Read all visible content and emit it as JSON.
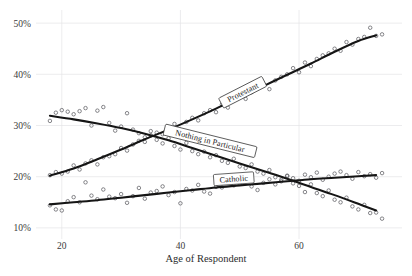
{
  "chart_data": {
    "type": "scatter",
    "title": "",
    "xlabel": "Age of Respondent",
    "ylabel": "",
    "xlim": [
      17,
      75
    ],
    "ylim": [
      9,
      51
    ],
    "grid": true,
    "legend_position": "inline-labels",
    "x_ticks": [
      20,
      40,
      60
    ],
    "x_tick_labels": [
      "20",
      "40",
      "60"
    ],
    "y_ticks": [
      10,
      20,
      30,
      40,
      50
    ],
    "y_tick_labels": [
      "10%",
      "20%",
      "30%",
      "40%",
      "50%"
    ],
    "series": [
      {
        "name": "Protestant",
        "label": "Protestant",
        "trend": [
          [
            18,
            20.2
          ],
          [
            22,
            21.6
          ],
          [
            26,
            23.4
          ],
          [
            30,
            25.3
          ],
          [
            34,
            27.3
          ],
          [
            38,
            29.2
          ],
          [
            42,
            31.2
          ],
          [
            46,
            33.3
          ],
          [
            50,
            35.5
          ],
          [
            54,
            37.7
          ],
          [
            58,
            39.9
          ],
          [
            62,
            42.1
          ],
          [
            66,
            44.4
          ],
          [
            70,
            46.5
          ],
          [
            73,
            47.6
          ]
        ],
        "points": [
          [
            18,
            20.3
          ],
          [
            19,
            20.9
          ],
          [
            20,
            20.6
          ],
          [
            21,
            21.0
          ],
          [
            22,
            22.2
          ],
          [
            23,
            21.4
          ],
          [
            24,
            22.6
          ],
          [
            25,
            23.2
          ],
          [
            26,
            22.4
          ],
          [
            27,
            23.8
          ],
          [
            28,
            24.0
          ],
          [
            29,
            24.4
          ],
          [
            30,
            25.6
          ],
          [
            31,
            25.1
          ],
          [
            32,
            26.3
          ],
          [
            33,
            27.0
          ],
          [
            34,
            26.8
          ],
          [
            35,
            28.1
          ],
          [
            36,
            28.6
          ],
          [
            37,
            28.3
          ],
          [
            38,
            29.6
          ],
          [
            39,
            30.3
          ],
          [
            40,
            29.1
          ],
          [
            41,
            30.7
          ],
          [
            42,
            31.5
          ],
          [
            43,
            31.0
          ],
          [
            44,
            32.4
          ],
          [
            45,
            33.0
          ],
          [
            46,
            32.6
          ],
          [
            47,
            34.1
          ],
          [
            48,
            33.5
          ],
          [
            49,
            34.9
          ],
          [
            50,
            35.7
          ],
          [
            51,
            35.2
          ],
          [
            52,
            36.5
          ],
          [
            53,
            37.4
          ],
          [
            54,
            38.0
          ],
          [
            55,
            37.1
          ],
          [
            56,
            38.8
          ],
          [
            57,
            39.5
          ],
          [
            58,
            40.0
          ],
          [
            59,
            41.2
          ],
          [
            60,
            40.4
          ],
          [
            61,
            42.3
          ],
          [
            62,
            41.6
          ],
          [
            63,
            43.0
          ],
          [
            64,
            43.7
          ],
          [
            65,
            44.1
          ],
          [
            66,
            45.0
          ],
          [
            67,
            44.6
          ],
          [
            68,
            46.3
          ],
          [
            69,
            45.8
          ],
          [
            70,
            46.9
          ],
          [
            71,
            47.3
          ],
          [
            72,
            49.1
          ],
          [
            73,
            47.5
          ],
          [
            74,
            47.8
          ]
        ]
      },
      {
        "name": "Nothing in Particular",
        "label": "Nothing in Particular",
        "trend": [
          [
            18,
            31.9
          ],
          [
            22,
            31.2
          ],
          [
            26,
            30.4
          ],
          [
            30,
            29.5
          ],
          [
            34,
            28.4
          ],
          [
            38,
            27.1
          ],
          [
            42,
            25.6
          ],
          [
            46,
            24.1
          ],
          [
            50,
            22.6
          ],
          [
            54,
            21.1
          ],
          [
            58,
            19.6
          ],
          [
            62,
            18.0
          ],
          [
            66,
            16.4
          ],
          [
            70,
            14.7
          ],
          [
            73,
            13.4
          ]
        ],
        "points": [
          [
            18,
            30.9
          ],
          [
            19,
            32.5
          ],
          [
            20,
            33.0
          ],
          [
            21,
            32.7
          ],
          [
            22,
            32.2
          ],
          [
            23,
            32.8
          ],
          [
            24,
            33.4
          ],
          [
            25,
            30.0
          ],
          [
            26,
            32.9
          ],
          [
            27,
            33.6
          ],
          [
            28,
            30.5
          ],
          [
            29,
            29.0
          ],
          [
            30,
            29.8
          ],
          [
            31,
            32.4
          ],
          [
            32,
            29.2
          ],
          [
            33,
            28.5
          ],
          [
            34,
            27.7
          ],
          [
            35,
            28.9
          ],
          [
            36,
            27.2
          ],
          [
            37,
            26.5
          ],
          [
            38,
            27.5
          ],
          [
            39,
            26.0
          ],
          [
            40,
            25.3
          ],
          [
            41,
            26.6
          ],
          [
            42,
            25.0
          ],
          [
            43,
            24.4
          ],
          [
            44,
            24.9
          ],
          [
            45,
            23.8
          ],
          [
            46,
            24.2
          ],
          [
            47,
            23.1
          ],
          [
            48,
            22.7
          ],
          [
            49,
            23.5
          ],
          [
            50,
            22.0
          ],
          [
            51,
            21.7
          ],
          [
            52,
            22.4
          ],
          [
            53,
            21.0
          ],
          [
            54,
            20.6
          ],
          [
            55,
            21.3
          ],
          [
            56,
            19.9
          ],
          [
            57,
            19.4
          ],
          [
            58,
            20.1
          ],
          [
            59,
            18.7
          ],
          [
            60,
            18.2
          ],
          [
            61,
            17.0
          ],
          [
            62,
            18.5
          ],
          [
            63,
            16.8
          ],
          [
            64,
            16.2
          ],
          [
            65,
            17.3
          ],
          [
            66,
            15.5
          ],
          [
            67,
            15.0
          ],
          [
            68,
            15.9
          ],
          [
            69,
            14.2
          ],
          [
            70,
            13.6
          ],
          [
            71,
            14.5
          ],
          [
            72,
            12.9
          ],
          [
            73,
            13.0
          ],
          [
            74,
            11.8
          ]
        ]
      },
      {
        "name": "Catholic",
        "label": "Catholic",
        "trend": [
          [
            18,
            14.6
          ],
          [
            22,
            15.0
          ],
          [
            26,
            15.4
          ],
          [
            30,
            15.9
          ],
          [
            34,
            16.4
          ],
          [
            38,
            16.9
          ],
          [
            42,
            17.4
          ],
          [
            46,
            17.9
          ],
          [
            50,
            18.3
          ],
          [
            54,
            18.7
          ],
          [
            58,
            19.1
          ],
          [
            62,
            19.5
          ],
          [
            66,
            19.8
          ],
          [
            70,
            20.1
          ],
          [
            73,
            20.3
          ]
        ],
        "points": [
          [
            18,
            14.4
          ],
          [
            19,
            13.6
          ],
          [
            20,
            13.4
          ],
          [
            21,
            15.2
          ],
          [
            22,
            16.0
          ],
          [
            23,
            15.0
          ],
          [
            24,
            18.9
          ],
          [
            25,
            16.3
          ],
          [
            26,
            15.6
          ],
          [
            27,
            17.5
          ],
          [
            28,
            16.1
          ],
          [
            29,
            15.8
          ],
          [
            30,
            16.6
          ],
          [
            31,
            14.9
          ],
          [
            32,
            16.2
          ],
          [
            33,
            17.8
          ],
          [
            34,
            15.7
          ],
          [
            35,
            16.9
          ],
          [
            36,
            17.2
          ],
          [
            37,
            18.1
          ],
          [
            38,
            16.4
          ],
          [
            39,
            17.0
          ],
          [
            40,
            14.8
          ],
          [
            41,
            17.6
          ],
          [
            42,
            17.3
          ],
          [
            43,
            18.4
          ],
          [
            44,
            17.1
          ],
          [
            45,
            16.7
          ],
          [
            46,
            18.0
          ],
          [
            47,
            17.9
          ],
          [
            48,
            19.0
          ],
          [
            49,
            18.3
          ],
          [
            50,
            18.6
          ],
          [
            51,
            19.3
          ],
          [
            52,
            18.1
          ],
          [
            53,
            17.4
          ],
          [
            54,
            18.8
          ],
          [
            55,
            19.5
          ],
          [
            56,
            18.5
          ],
          [
            57,
            19.1
          ],
          [
            58,
            20.2
          ],
          [
            59,
            19.7
          ],
          [
            60,
            19.2
          ],
          [
            61,
            20.4
          ],
          [
            62,
            19.9
          ],
          [
            63,
            20.8
          ],
          [
            64,
            19.4
          ],
          [
            65,
            20.0
          ],
          [
            66,
            20.6
          ],
          [
            67,
            21.0
          ],
          [
            68,
            20.3
          ],
          [
            69,
            19.6
          ],
          [
            70,
            20.9
          ],
          [
            71,
            20.1
          ],
          [
            72,
            20.5
          ],
          [
            73,
            19.8
          ],
          [
            74,
            20.7
          ]
        ]
      }
    ]
  }
}
